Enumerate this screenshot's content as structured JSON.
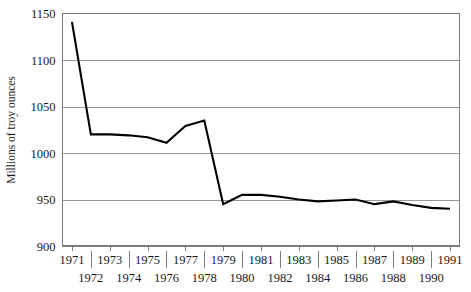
{
  "chart_data": {
    "type": "line",
    "title": "",
    "subtitle": "",
    "xlabel": "",
    "ylabel": "Millions of troy ounces",
    "x": [
      1971,
      1972,
      1973,
      1974,
      1975,
      1976,
      1977,
      1978,
      1979,
      1980,
      1981,
      1982,
      1983,
      1984,
      1985,
      1986,
      1987,
      1988,
      1989,
      1990,
      1991
    ],
    "values": [
      1141,
      1020,
      1020,
      1019,
      1017,
      1011,
      1029,
      1035,
      945,
      955,
      955,
      953,
      950,
      948,
      949,
      950,
      945,
      948,
      944,
      941,
      940
    ],
    "series": [
      {
        "name": "Millions of troy ounces",
        "values": [
          1141,
          1020,
          1020,
          1019,
          1017,
          1011,
          1029,
          1035,
          945,
          955,
          955,
          953,
          950,
          948,
          949,
          950,
          945,
          948,
          944,
          941,
          940
        ]
      }
    ],
    "xlim": [
      1970.5,
      1991.5
    ],
    "ylim": [
      900,
      1150
    ],
    "yticks": [
      900,
      950,
      1000,
      1050,
      1100,
      1150
    ],
    "ytick_labels": [
      "900",
      "950",
      "1000",
      "1050",
      "1100",
      "1150"
    ],
    "xticks_top_row": [
      1971,
      1973,
      1975,
      1977,
      1979,
      1981,
      1983,
      1985,
      1987,
      1989,
      1991
    ],
    "xticks_top_row_labels": [
      "1971",
      "1973",
      "1975",
      "1977",
      "1979",
      "1981",
      "1983",
      "1985",
      "1987",
      "1989",
      "1991"
    ],
    "xticks_bottom_row": [
      1972,
      1974,
      1976,
      1978,
      1980,
      1982,
      1984,
      1986,
      1988,
      1990
    ],
    "xticks_bottom_row_labels": [
      "1972",
      "1974",
      "1976",
      "1978",
      "1980",
      "1982",
      "1984",
      "1986",
      "1988",
      "1990"
    ],
    "grid": "horizontal",
    "legend": "none",
    "line_color": "#000000",
    "grid_color": "#8c8c8c",
    "frame_color": "#7a7a7a",
    "background_color": "#ffffff",
    "annotations": []
  }
}
